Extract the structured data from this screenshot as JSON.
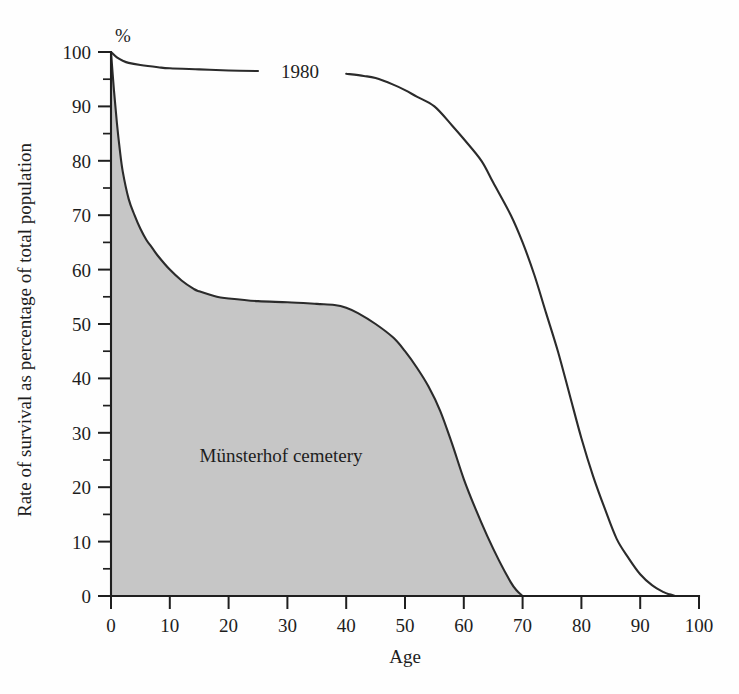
{
  "figure": {
    "unit_label": "%",
    "background_color": "#fefefe",
    "line_color": "#2b2b2b",
    "fill_color": "#c6c6c6"
  },
  "axes": {
    "x": {
      "title": "Age",
      "min": 0,
      "max": 100,
      "ticks": [
        0,
        10,
        20,
        30,
        40,
        50,
        60,
        70,
        80,
        90,
        100
      ],
      "tick_labels": [
        "0",
        "10",
        "20",
        "30",
        "40",
        "50",
        "60",
        "70",
        "80",
        "90",
        "100"
      ]
    },
    "y": {
      "title": "Rate of survival as percentage of total population",
      "min": 0,
      "max": 100,
      "ticks": [
        0,
        10,
        20,
        30,
        40,
        50,
        60,
        70,
        80,
        90,
        100
      ],
      "tick_labels": [
        "0",
        "10",
        "20",
        "30",
        "40",
        "50",
        "60",
        "70",
        "80",
        "90",
        "100"
      ],
      "minor_ticks": [
        5,
        15,
        25,
        35,
        45,
        55,
        65,
        75,
        85,
        95
      ]
    }
  },
  "annotations": {
    "series_1980_label": "1980",
    "cemetery_label": "Münsterhof cemetery"
  },
  "chart_data": {
    "type": "line",
    "title": "",
    "subtitle": "",
    "xlabel": "Age",
    "ylabel": "Rate of survival as percentage of total population",
    "xlim": [
      0,
      100
    ],
    "ylim": [
      0,
      100
    ],
    "grid": false,
    "legend": "inline-annotations",
    "y_unit": "%",
    "series": [
      {
        "name": "Münsterhof cemetery",
        "style": "filled-area",
        "fill": "#c6c6c6",
        "stroke": "#2b2b2b",
        "label_position": {
          "x": 26,
          "y": 27
        },
        "x": [
          0,
          0.5,
          1,
          1.5,
          2,
          3,
          4,
          5,
          6,
          7,
          8,
          10,
          12,
          14,
          15,
          18,
          20,
          25,
          30,
          35,
          38,
          40,
          42,
          45,
          48,
          50,
          52,
          54,
          56,
          58,
          60,
          62,
          64,
          66,
          68,
          69,
          70
        ],
        "y": [
          100,
          93,
          87,
          82,
          78,
          73,
          70,
          67.5,
          65.5,
          64,
          62.5,
          60,
          58,
          56.5,
          56,
          55,
          54.7,
          54.2,
          54,
          53.7,
          53.5,
          53,
          52,
          50,
          47.5,
          45,
          42,
          38.5,
          34,
          28,
          21.5,
          16,
          11,
          6.5,
          2.5,
          1,
          0
        ]
      },
      {
        "name": "1980",
        "style": "line",
        "stroke": "#2b2b2b",
        "label_position": {
          "x": 32,
          "y": 97
        },
        "x": [
          0,
          1,
          2,
          3,
          5,
          8,
          10,
          15,
          20,
          25,
          30,
          35,
          40,
          43,
          45,
          48,
          50,
          52,
          55,
          58,
          60,
          63,
          65,
          68,
          70,
          72,
          74,
          76,
          78,
          80,
          82,
          84,
          86,
          88,
          90,
          92,
          94,
          95,
          96
        ],
        "y": [
          100,
          99,
          98.4,
          98,
          97.6,
          97.2,
          97,
          96.8,
          96.6,
          96.5,
          96.4,
          96.2,
          96,
          95.6,
          95.2,
          94,
          93,
          91.8,
          90,
          86.5,
          84,
          80,
          76,
          70,
          65,
          59,
          52,
          45,
          37,
          29,
          22,
          16,
          10.5,
          7,
          4,
          2,
          0.7,
          0.3,
          0
        ]
      }
    ]
  }
}
